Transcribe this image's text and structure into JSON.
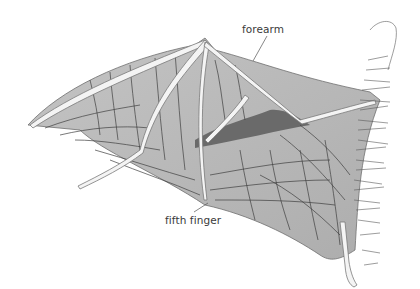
{
  "diagram": {
    "labels": {
      "forearm": "forearm",
      "fifth_finger": "fifth finger"
    }
  },
  "colors": {
    "background": "#ffffff",
    "membrane": "#b9b9b9",
    "membrane_light": "#cfcfcf",
    "membrane_dark": "#6a6a6a",
    "bone": "#f4f4f4",
    "vein": "#3a3a3a",
    "leader_line": "#555555"
  }
}
